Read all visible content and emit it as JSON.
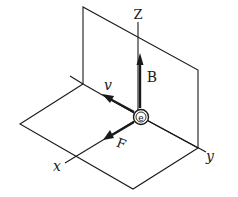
{
  "diagram": {
    "colors": {
      "ink": "#1a1a1a",
      "background": "#ffffff"
    },
    "axes": [
      {
        "id": "x",
        "label": "x"
      },
      {
        "id": "y",
        "label": "y"
      },
      {
        "id": "z",
        "label": "Z"
      }
    ],
    "vectors": [
      {
        "id": "B",
        "label": "B",
        "direction": "+z"
      },
      {
        "id": "v",
        "label": "v",
        "direction": "-y"
      },
      {
        "id": "F",
        "label": "F",
        "direction": "+x"
      }
    ],
    "particle": {
      "symbol": "e",
      "name": "electron"
    },
    "planes": [
      "vertical yz-plane",
      "horizontal xy-plane"
    ]
  }
}
